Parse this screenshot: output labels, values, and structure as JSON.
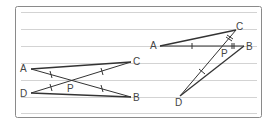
{
  "figure": {
    "frame_color": "#8a8a8a",
    "ruled_line_color": "#c8c8c8",
    "segment_color": "#333333",
    "left_diagram": {
      "points": {
        "A": {
          "label": "A",
          "x": 31,
          "y": 69
        },
        "C": {
          "label": "C",
          "x": 131,
          "y": 62
        },
        "D": {
          "label": "D",
          "x": 31,
          "y": 93
        },
        "B": {
          "label": "B",
          "x": 131,
          "y": 97
        },
        "P": {
          "label": "P",
          "x": 71,
          "y": 82
        }
      },
      "segments": [
        "AC",
        "DB",
        "AB",
        "DC"
      ],
      "equal_marks": [
        {
          "segment": "AP",
          "ticks": 1
        },
        {
          "segment": "PB",
          "ticks": 1
        },
        {
          "segment": "DP",
          "ticks": 1
        },
        {
          "segment": "PC",
          "ticks": 1
        }
      ]
    },
    "right_diagram": {
      "points": {
        "A": {
          "label": "A",
          "x": 160,
          "y": 46
        },
        "C": {
          "label": "C",
          "x": 236,
          "y": 30
        },
        "B": {
          "label": "B",
          "x": 244,
          "y": 46
        },
        "D": {
          "label": "D",
          "x": 180,
          "y": 96
        },
        "P": {
          "label": "P",
          "x": 224,
          "y": 47
        }
      },
      "segments": [
        "AC",
        "AB",
        "DC",
        "DB"
      ],
      "equal_marks": [
        {
          "segment": "AP",
          "ticks": 1
        },
        {
          "segment": "PB",
          "ticks": 2
        },
        {
          "segment": "DP",
          "ticks": 1
        },
        {
          "segment": "PC",
          "ticks": 2
        }
      ]
    }
  }
}
